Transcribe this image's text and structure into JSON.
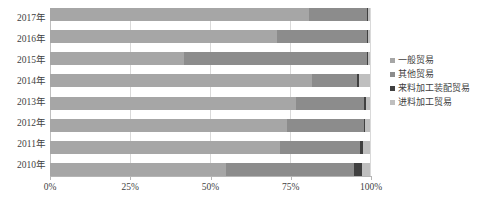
{
  "chart": {
    "type": "bar",
    "orientation": "horizontal",
    "stacked": true,
    "normalized": true
  },
  "legend": {
    "position": "right",
    "items": [
      {
        "label": "一般贸易",
        "color": "#a6a6a6"
      },
      {
        "label": "其他贸易",
        "color": "#8c8c8c"
      },
      {
        "label": "来料加工装配贸易",
        "color": "#404040"
      },
      {
        "label": "进料加工贸易",
        "color": "#bfbfbf"
      }
    ]
  },
  "axes": {
    "x": {
      "ticks": [
        {
          "value": 0,
          "label": "0%"
        },
        {
          "value": 25,
          "label": "25%"
        },
        {
          "value": 50,
          "label": "50%"
        },
        {
          "value": 75,
          "label": "75%"
        },
        {
          "value": 100,
          "label": "100%"
        }
      ],
      "min": 0,
      "max": 100,
      "grid": true
    },
    "y": {
      "categories": [
        "2017年",
        "2016年",
        "2015年",
        "2014年",
        "2013年",
        "2012年",
        "2011年",
        "2010年"
      ]
    }
  },
  "chart_data": {
    "type": "bar",
    "orientation": "horizontal",
    "stacked": true,
    "normalized": true,
    "title": "",
    "subtitle": "",
    "xlabel": "",
    "ylabel": "",
    "xlim": [
      0,
      100
    ],
    "grid": true,
    "legend_position": "right",
    "categories": [
      "2017年",
      "2016年",
      "2015年",
      "2014年",
      "2013年",
      "2012年",
      "2011年",
      "2010年"
    ],
    "xtick_labels": [
      "0%",
      "25%",
      "50%",
      "75%",
      "100%"
    ],
    "series": [
      {
        "name": "一般贸易",
        "color": "#a6a6a6",
        "values": [
          81,
          71,
          42,
          82,
          77,
          74,
          72,
          55
        ]
      },
      {
        "name": "其他贸易",
        "color": "#8c8c8c",
        "values": [
          18,
          28,
          57,
          14,
          21,
          24,
          25,
          40
        ]
      },
      {
        "name": "来料加工装配贸易",
        "color": "#404040",
        "values": [
          0.5,
          0.5,
          0.5,
          0.5,
          0.6,
          0.5,
          0.7,
          2.5
        ]
      },
      {
        "name": "进料加工贸易",
        "color": "#bfbfbf",
        "values": [
          0.5,
          0.5,
          0.5,
          3.5,
          1.4,
          1.5,
          2.3,
          2.5
        ]
      }
    ]
  },
  "style": {
    "gridline_color": "#d9d9d9",
    "axis_color": "#b5b5b5",
    "text_color": "#3f3f3f",
    "background": "#ffffff"
  }
}
